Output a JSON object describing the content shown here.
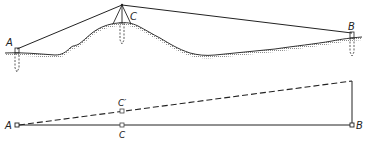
{
  "figure": {
    "type": "surveying-diagram",
    "colors": {
      "ink": "#222222",
      "ground_hatch": "#9a9a9a",
      "background": "#ffffff"
    }
  },
  "profile": {
    "labels": {
      "a": "A",
      "b": "B",
      "c": "C"
    },
    "instrument_apex": [
      122,
      5
    ],
    "station_a": [
      17,
      49
    ],
    "station_b": [
      352,
      33
    ]
  },
  "plan": {
    "labels": {
      "a": "A",
      "b": "B",
      "c": "C",
      "c_prime": "C′"
    },
    "point_a": [
      17,
      125
    ],
    "point_b": [
      352,
      125
    ],
    "point_c": [
      122,
      125
    ],
    "point_c_prime": [
      122,
      111
    ],
    "dashed_end": [
      352,
      81
    ]
  }
}
